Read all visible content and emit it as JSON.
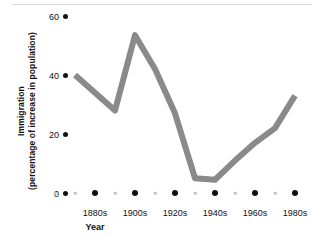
{
  "chart_data": {
    "type": "line",
    "title": "",
    "xlabel": "Year",
    "ylabel_line1": "Immigration",
    "ylabel_line2": "(percentage of increase in population)",
    "ylabel": "Immigration (percentage of increase in population)",
    "categories": [
      "1870s",
      "1880s",
      "1890s",
      "1900s",
      "1910s",
      "1920s",
      "1930s",
      "1940s",
      "1950s",
      "1960s",
      "1970s",
      "1980s"
    ],
    "x_tick_labels": [
      "1880s",
      "1900s",
      "1920s",
      "1940s",
      "1960s",
      "1980s"
    ],
    "y_tick_labels": [
      "0",
      "20",
      "40",
      "60"
    ],
    "y_tick_values": [
      0,
      20,
      40,
      60
    ],
    "ylim": [
      0,
      62
    ],
    "values": [
      40,
      34,
      28,
      53.5,
      42,
      27,
      5,
      4.5,
      11,
      17,
      22,
      33
    ],
    "series": [
      {
        "name": "Immigration (percentage of increase in population)",
        "values": [
          40,
          34,
          28,
          53.5,
          42,
          27,
          5,
          4.5,
          11,
          17,
          22,
          33
        ]
      }
    ],
    "line_color": "#8a8a8a",
    "line_width": 6,
    "grid": false,
    "legend": "none",
    "axis_marker_style": "dots",
    "marker_color": "#111111",
    "minor_marker_color": "#bdbdbd",
    "background": "#ffffff"
  }
}
